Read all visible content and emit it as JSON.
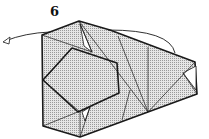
{
  "step": {
    "number": "6"
  },
  "colors": {
    "paper": "#d4d4d4",
    "line": "#1a1a1a",
    "background": "#ffffff"
  },
  "annotations": {
    "arrow_left": "turn-over / fold-behind arrow",
    "arrow_right": "fold arrow over top edge"
  }
}
